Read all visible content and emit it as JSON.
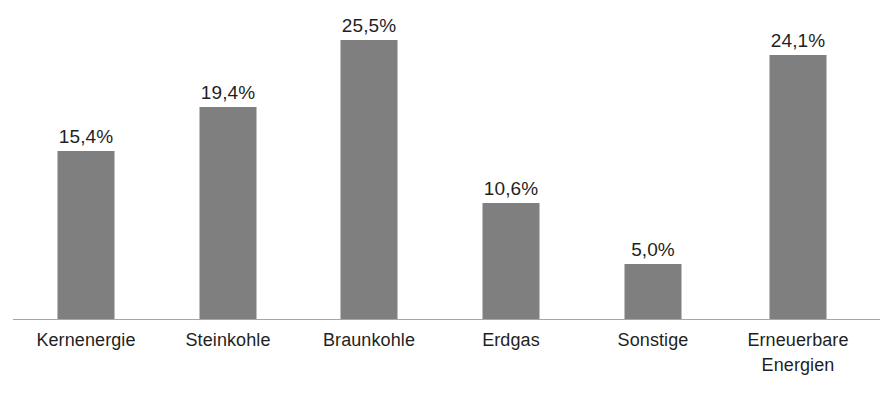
{
  "chart_data": {
    "type": "bar",
    "title": "",
    "subtitle": "",
    "xlabel": "",
    "ylabel": "",
    "categories": [
      "Kernenergie",
      "Steinkohle",
      "Braunkohle",
      "Erdgas",
      "Sonstige",
      "Erneuerbare\nEnergien"
    ],
    "values": [
      15.4,
      19.4,
      25.5,
      10.6,
      5.0,
      24.1
    ],
    "value_labels": [
      "15,4%",
      "19,4%",
      "25,5%",
      "10,6%",
      "5,0%",
      "24,1%"
    ],
    "ylim": [
      0,
      31.0
    ],
    "grid": false,
    "legend": false,
    "legend_position": "none",
    "bar_color": "#7f7f7f",
    "axis_color": "#a6a6a6",
    "text_color": "#1f1f1f",
    "background_color": "#ffffff",
    "decimal_separator": ",",
    "unit": "%"
  }
}
